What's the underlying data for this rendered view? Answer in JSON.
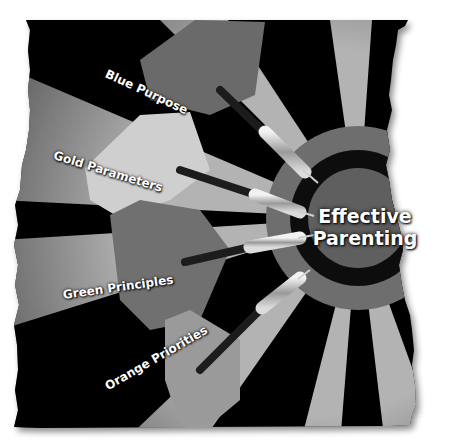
{
  "illustration": {
    "center_title_line1": "Effective",
    "center_title_line2": "Parenting",
    "darts": [
      {
        "label": "Blue Purpose"
      },
      {
        "label": "Gold Parameters"
      },
      {
        "label": "Green Principles"
      },
      {
        "label": "Orange Priorities"
      }
    ],
    "colors": {
      "board_dark": "#000000",
      "board_light": "#b3b3b3",
      "ring_outer": "#6e6e6e",
      "ring_dark": "#111111",
      "bullseye": "#5e5e5e",
      "flight_blue": "#6a6a6a",
      "flight_gold": "#c8c8c8",
      "flight_green": "#707070",
      "flight_orange": "#9a9a9a"
    }
  }
}
